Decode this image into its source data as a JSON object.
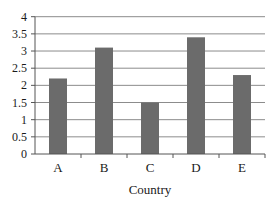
{
  "chart_data": {
    "type": "bar",
    "title": "",
    "xlabel": "Country",
    "ylabel": "",
    "categories": [
      "A",
      "B",
      "C",
      "D",
      "E"
    ],
    "values": [
      2.2,
      3.1,
      1.5,
      3.4,
      2.3
    ],
    "ylim": [
      0,
      4
    ],
    "yticks": [
      "0",
      "0.5",
      "1",
      "1.5",
      "2",
      "2.5",
      "3",
      "3.5",
      "4"
    ],
    "grid": true,
    "legend": null,
    "colors": {
      "bar": "#6b6b6b",
      "grid": "#8c8c8c",
      "axis": "#555555",
      "text": "#1a1a1a"
    }
  },
  "labels": {
    "x_axis_title": "Country",
    "categories": [
      "A",
      "B",
      "C",
      "D",
      "E"
    ],
    "yticks": [
      "0",
      "0.5",
      "1",
      "1.5",
      "2",
      "2.5",
      "3",
      "3.5",
      "4"
    ]
  }
}
